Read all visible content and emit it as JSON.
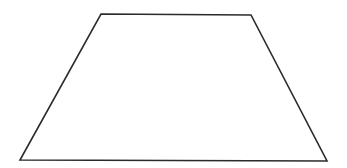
{
  "diagram": {
    "shape": "trapezoid",
    "fill": "#ffffff",
    "stroke": "#2b2b2b",
    "background": "#ffffff"
  }
}
